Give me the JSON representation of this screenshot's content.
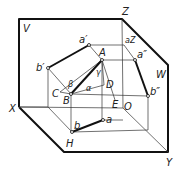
{
  "figure": {
    "planes": {
      "V": "V",
      "W": "W",
      "H": "H"
    },
    "axes": {
      "X": "X",
      "Y": "Y",
      "Z": "Z",
      "O": "O"
    },
    "points": {
      "A": "A",
      "B": "B",
      "C": "C",
      "D": "D",
      "E": "E",
      "a_prime": "a′",
      "b_prime": "b′",
      "a": "a",
      "b": "b",
      "a_z": "aZ",
      "a_dprime": "a″",
      "b_dprime": "b″"
    },
    "angles": {
      "alpha": "α",
      "beta": "β",
      "gamma": "γ"
    }
  }
}
